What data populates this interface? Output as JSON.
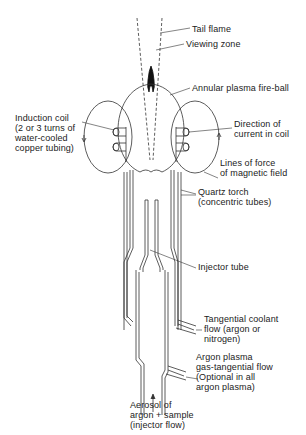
{
  "diagram": {
    "labels": {
      "tail_flame": "Tail flame",
      "viewing_zone": "Viewing zone",
      "fireball": "Annular plasma fire-ball",
      "induction_coil": "Induction coil\n(2 or 3 turns of\nwater-cooled\ncopper tubing)",
      "current_direction": "Direction of\ncurrent in coil",
      "magnetic_field": "Lines of force\nof magnetic field",
      "quartz_torch": "Quartz torch\n(concentric tubes)",
      "injector_tube": "Injector tube",
      "coolant_flow": "Tangential coolant\nflow (argon or\nnitrogen)",
      "plasma_gas": "Argon plasma\ngas-tangential flow\n(Optional in all\nargon plasma)",
      "aerosol": "Aerosol of\nargon + sample\n(injector flow)"
    },
    "colors": {
      "line": "#333333",
      "flame": "#111111",
      "background": "#ffffff"
    }
  }
}
